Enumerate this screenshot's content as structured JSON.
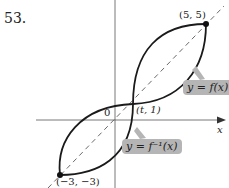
{
  "problem_number": "53.",
  "figure": {
    "points": [
      {
        "label": "(5, 5)",
        "x": 5,
        "y": 5
      },
      {
        "label": "(−3, −3)",
        "x": -3,
        "y": -3
      },
      {
        "label": "(t, 1)",
        "x": "t",
        "y": 1
      }
    ],
    "origin_label": "0",
    "x_axis_label": "x",
    "curves": [
      {
        "label": "y = f(x)"
      },
      {
        "label": "y = f⁻¹(x)"
      }
    ],
    "line_style": {
      "curve_color": "#1a1a1a",
      "dashed_line": "y = x",
      "callout_color": "#b5b5b5"
    }
  }
}
